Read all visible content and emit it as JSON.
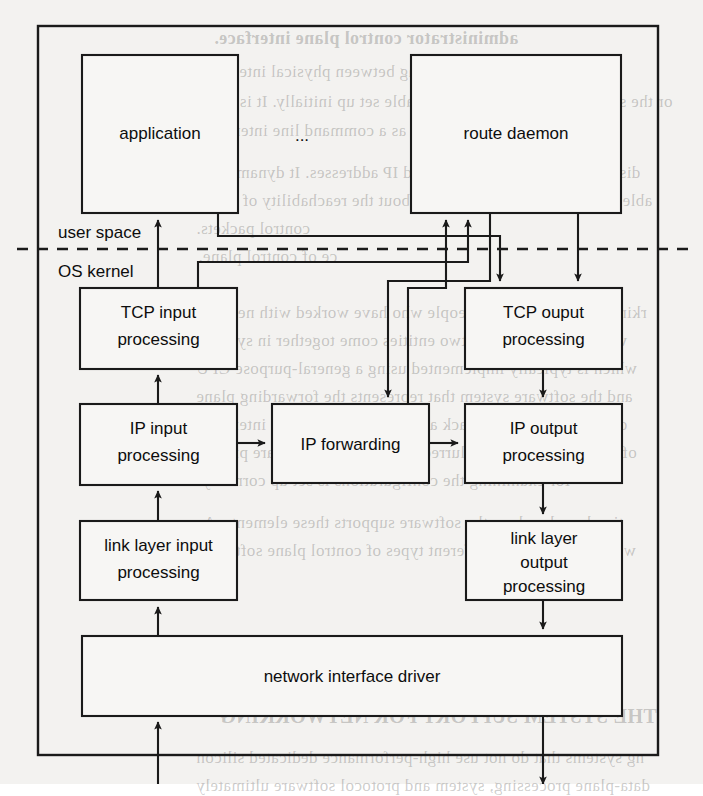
{
  "figure": {
    "outer_frame": {
      "x": 38,
      "y": 26,
      "width": 620,
      "height": 729
    },
    "divider": {
      "label_above": "user space",
      "label_below": "OS kernel",
      "y": 249,
      "x_start": 17,
      "x_end": 691,
      "style": "dashed"
    },
    "nodes": [
      {
        "id": "application",
        "label": "application",
        "lines": [
          "application"
        ],
        "x": 82,
        "y": 55,
        "width": 156,
        "height": 158
      },
      {
        "id": "ellipsis",
        "label": "...",
        "lines": [
          "..."
        ],
        "x": 282,
        "y": 120,
        "width": 40,
        "height": 30
      },
      {
        "id": "route-daemon",
        "label": "route daemon",
        "lines": [
          "route daemon"
        ],
        "x": 411,
        "y": 55,
        "width": 210,
        "height": 158
      },
      {
        "id": "tcp-input",
        "label": "TCP input processing",
        "lines": [
          "TCP input",
          "processing"
        ],
        "x": 80,
        "y": 288,
        "width": 157,
        "height": 81
      },
      {
        "id": "tcp-output",
        "label": "TCP ouput processing",
        "lines": [
          "TCP ouput",
          "processing"
        ],
        "x": 465,
        "y": 288,
        "width": 157,
        "height": 81
      },
      {
        "id": "ip-input",
        "label": "IP input processing",
        "lines": [
          "IP input",
          "processing"
        ],
        "x": 80,
        "y": 404,
        "width": 157,
        "height": 81
      },
      {
        "id": "ip-forwarding",
        "label": "IP forwarding",
        "lines": [
          "IP forwarding"
        ],
        "x": 272,
        "y": 404,
        "width": 157,
        "height": 79
      },
      {
        "id": "ip-output",
        "label": "IP output processing",
        "lines": [
          "IP output",
          "processing"
        ],
        "x": 465,
        "y": 404,
        "width": 157,
        "height": 79
      },
      {
        "id": "link-input",
        "label": "link layer input processing",
        "lines": [
          "link layer input",
          "processing"
        ],
        "x": 80,
        "y": 521,
        "width": 157,
        "height": 79
      },
      {
        "id": "link-output",
        "label": "link layer output processing",
        "lines": [
          "link layer",
          "output",
          "processing"
        ],
        "x": 466,
        "y": 521,
        "width": 156,
        "height": 79
      },
      {
        "id": "nic-driver",
        "label": "network interface driver",
        "lines": [
          "network interface driver"
        ],
        "x": 82,
        "y": 636,
        "width": 540,
        "height": 80
      }
    ],
    "edges": [
      {
        "id": "driver-to-link-input",
        "from": "nic-driver",
        "to": "link-input",
        "kind": "arrow-up"
      },
      {
        "id": "link-input-to-ip-input",
        "from": "link-input",
        "to": "ip-input",
        "kind": "arrow-up"
      },
      {
        "id": "ip-input-to-tcp-input",
        "from": "ip-input",
        "to": "tcp-input",
        "kind": "arrow-up"
      },
      {
        "id": "tcp-input-to-application",
        "from": "tcp-input",
        "to": "application",
        "kind": "arrow-up"
      },
      {
        "id": "ip-input-to-ip-forwarding",
        "from": "ip-input",
        "to": "ip-forwarding",
        "kind": "arrow-right"
      },
      {
        "id": "ip-forwarding-to-ip-output",
        "from": "ip-forwarding",
        "to": "ip-output",
        "kind": "arrow-right"
      },
      {
        "id": "tcp-output-to-ip-output",
        "from": "tcp-output",
        "to": "ip-output",
        "kind": "arrow-down"
      },
      {
        "id": "ip-output-to-link-output",
        "from": "ip-output",
        "to": "link-output",
        "kind": "arrow-down"
      },
      {
        "id": "link-output-to-driver",
        "from": "link-output",
        "to": "nic-driver",
        "kind": "arrow-down"
      },
      {
        "id": "application-to-tcp-output",
        "from": "application",
        "to": "tcp-output",
        "kind": "routed-down"
      },
      {
        "id": "route-daemon-to-tcp-output",
        "from": "route-daemon",
        "to": "tcp-output",
        "kind": "routed-down"
      },
      {
        "id": "tcp-input-to-route-daemon",
        "from": "tcp-input",
        "to": "route-daemon",
        "kind": "routed-up"
      },
      {
        "id": "ip-forwarding-to-route-daemon",
        "from": "ip-forwarding",
        "to": "route-daemon",
        "kind": "routed-up"
      },
      {
        "id": "external-in-to-driver",
        "from": "network",
        "to": "nic-driver",
        "kind": "arrow-up"
      },
      {
        "id": "driver-to-external-out",
        "from": "nic-driver",
        "to": "network",
        "kind": "arrow-down"
      }
    ]
  },
  "bleed_text": {
    "lines": [
      {
        "text": "administrator control plane interface.",
        "x": 214,
        "y": 28,
        "size": 18,
        "bold": true
      },
      {
        "text": "ace, which allows the mapping between physical interfaces",
        "x": 196,
        "y": 62,
        "size": 17,
        "bold": false
      },
      {
        "text": "or the system to be configured and table set up initially. It is often",
        "x": 198,
        "y": 92,
        "size": 17,
        "bold": false
      },
      {
        "text": "as a command line interface.",
        "x": 200,
        "y": 121,
        "size": 17,
        "bold": false
      },
      {
        "text": "distributed system to pre-defined IP addresses. It dynamically",
        "x": 196,
        "y": 163,
        "size": 17,
        "bold": false
      },
      {
        "text": "ables. This requires information about the reachability of nodes",
        "x": 196,
        "y": 191,
        "size": 17,
        "bold": false
      },
      {
        "text": "control packets.",
        "x": 196,
        "y": 219,
        "size": 17,
        "bold": false
      },
      {
        "text": "ce of control plane.",
        "x": 198,
        "y": 247,
        "size": 17,
        "bold": false
      },
      {
        "text": "rking field for the most people who have worked with network",
        "x": 196,
        "y": 303,
        "size": 17,
        "bold": false
      },
      {
        "text": "ware. In this case, the two entities come together in systems",
        "x": 196,
        "y": 331,
        "size": 17,
        "bold": false
      },
      {
        "text": "which is typically implemented using a general-purpose CPU",
        "x": 196,
        "y": 359,
        "size": 17,
        "bold": false
      },
      {
        "text": "and the software system that represents the forwarding plane",
        "x": 196,
        "y": 387,
        "size": 17,
        "bold": false
      },
      {
        "text": "data with a protocol stack and a series of network interfaces",
        "x": 196,
        "y": 415,
        "size": 17,
        "bold": false
      },
      {
        "text": "of the two elements is blurred; and yet, both parts are present",
        "x": 196,
        "y": 443,
        "size": 17,
        "bold": false
      },
      {
        "text": "for examining the configurations is set up correctly.",
        "x": 198,
        "y": 471,
        "size": 17,
        "bold": false
      },
      {
        "text": "tion based on how the software supports these elements. As",
        "x": 196,
        "y": 513,
        "size": 17,
        "bold": false
      },
      {
        "text": "we now do with the different types of control plane software.",
        "x": 196,
        "y": 541,
        "size": 17,
        "bold": false
      },
      {
        "text": "THE SYSTEM SUPPORT FOR NETWORKING",
        "x": 220,
        "y": 705,
        "size": 20,
        "bold": true
      },
      {
        "text": "ng systems that do not use high-performance dedicated silicon",
        "x": 196,
        "y": 748,
        "size": 17,
        "bold": false
      },
      {
        "text": "data-plane processing, system and protocol software ultimately",
        "x": 196,
        "y": 776,
        "size": 17,
        "bold": false
      }
    ]
  }
}
